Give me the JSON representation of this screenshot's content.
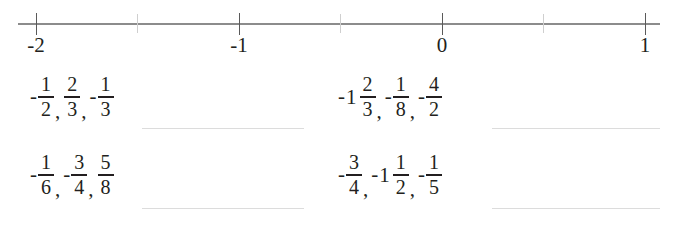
{
  "worksheet": {
    "background_color": "#ffffff",
    "text_color": "#231f20"
  },
  "number_line": {
    "axis_color": "#8c8c8c",
    "major_tick_color": "#5a5a5a",
    "minor_tick_color": "#cfcfcf",
    "min": -2,
    "max": 1,
    "major_ticks": [
      {
        "value": -2,
        "label": "-2",
        "x": 36
      },
      {
        "value": -1,
        "label": "-1",
        "x": 239
      },
      {
        "value": 0,
        "label": "0",
        "x": 442
      },
      {
        "value": 1,
        "label": "1",
        "x": 645
      }
    ],
    "minor_ticks": [
      {
        "value": -1.5,
        "x": 137
      },
      {
        "value": -0.5,
        "x": 340
      },
      {
        "value": 0.5,
        "x": 543
      }
    ]
  },
  "rows": [
    {
      "id": "row-1",
      "left_group": {
        "terms": [
          {
            "sign": "-",
            "whole": "",
            "numerator": "1",
            "denominator": "2"
          },
          {
            "sign": "",
            "whole": "",
            "numerator": "2",
            "denominator": "3"
          },
          {
            "sign": "-",
            "whole": "",
            "numerator": "1",
            "denominator": "3"
          }
        ],
        "separator": ","
      },
      "right_group": {
        "terms": [
          {
            "sign": "-",
            "whole": "1",
            "numerator": "2",
            "denominator": "3"
          },
          {
            "sign": "-",
            "whole": "",
            "numerator": "1",
            "denominator": "8"
          },
          {
            "sign": "-",
            "whole": "",
            "numerator": "4",
            "denominator": "2"
          }
        ],
        "separator": ","
      }
    },
    {
      "id": "row-2",
      "left_group": {
        "terms": [
          {
            "sign": "-",
            "whole": "",
            "numerator": "1",
            "denominator": "6"
          },
          {
            "sign": "-",
            "whole": "",
            "numerator": "3",
            "denominator": "4"
          },
          {
            "sign": "",
            "whole": "",
            "numerator": "5",
            "denominator": "8"
          }
        ],
        "separator": ","
      },
      "right_group": {
        "terms": [
          {
            "sign": "-",
            "whole": "",
            "numerator": "3",
            "denominator": "4"
          },
          {
            "sign": "-",
            "whole": "1",
            "numerator": "1",
            "denominator": "2"
          },
          {
            "sign": "-",
            "whole": "",
            "numerator": "1",
            "denominator": "5"
          }
        ],
        "separator": ","
      }
    }
  ],
  "answer_blanks": {
    "color": "#dcdcdc",
    "count": 4
  }
}
